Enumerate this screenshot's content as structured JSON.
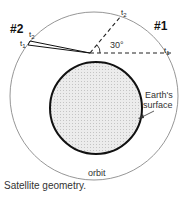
{
  "diagram": {
    "labels": {
      "sat1": "#1",
      "sat2": "#2",
      "t1_right": "t",
      "t1_right_sub": "1",
      "t2_top": "t",
      "t2_top_sub": "2",
      "t1_left": "t",
      "t1_left_sub": "1",
      "t2_left": "t",
      "t2_left_sub": "2",
      "angle": "30°",
      "earth_line1": "Earth's",
      "earth_line2": "surface",
      "orbit": "orbit"
    },
    "colors": {
      "orbit": "#888888",
      "earth_outline": "#111111",
      "earth_fill": "#e6e6e6",
      "dashed": "#222222"
    }
  },
  "caption": "Satellite geometry."
}
